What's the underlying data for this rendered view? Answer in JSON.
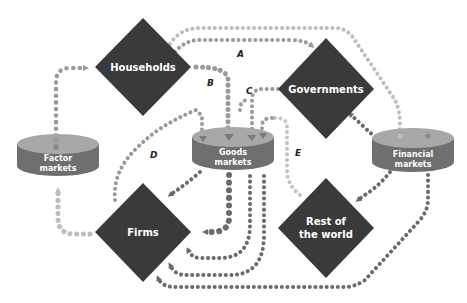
{
  "diagram": {
    "nodes": {
      "households": {
        "label": "Households",
        "shape": "diamond"
      },
      "governments": {
        "label": "Governments",
        "shape": "diamond"
      },
      "firms": {
        "label": "Firms",
        "shape": "diamond"
      },
      "rest_of_world": {
        "label_line1": "Rest of",
        "label_line2": "the world",
        "shape": "diamond"
      },
      "factor_markets": {
        "label_line1": "Factor",
        "label_line2": "markets",
        "shape": "cylinder"
      },
      "goods_markets": {
        "label_line1": "Goods",
        "label_line2": "markets",
        "shape": "cylinder"
      },
      "financial_markets": {
        "label_line1": "Financial",
        "label_line2": "markets",
        "shape": "cylinder"
      }
    },
    "flow_labels": {
      "a": "A",
      "b": "B",
      "c": "C",
      "d": "D",
      "e": "E"
    },
    "colors": {
      "diamond": "#3a3a3a",
      "cylinder_side": "#6f6f6f",
      "cylinder_top": "#a8a8a8",
      "flow_dark": "#6a6a6a",
      "flow_mid": "#9a9a9a",
      "flow_light": "#c4c4c4"
    }
  }
}
